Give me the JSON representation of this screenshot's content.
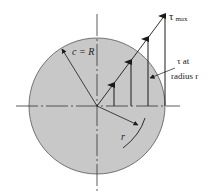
{
  "diagram": {
    "type": "shear-stress-distribution-circular-shaft",
    "colors": {
      "shaft_fill": "#c8c8c8",
      "line": "#1a1a1a",
      "background": "#ffffff"
    },
    "labels": {
      "tau_max_symbol": "τ",
      "tau_max_subscript": "max",
      "tau_at_line1": "τ at",
      "tau_at_line2": "radius r",
      "radius_label": "c = R",
      "r_label": "r"
    },
    "arrows": [
      {
        "x": 114,
        "tip_y": 85
      },
      {
        "x": 131,
        "tip_y": 62
      },
      {
        "x": 148,
        "tip_y": 39
      },
      {
        "x": 165,
        "tip_y": 16
      }
    ]
  }
}
